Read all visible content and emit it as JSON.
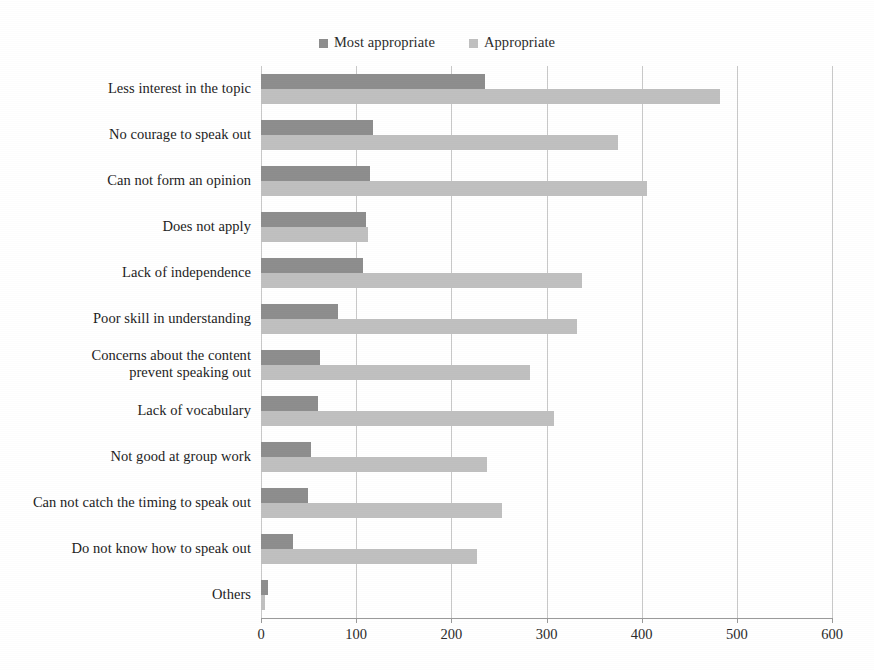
{
  "chart_data": {
    "type": "bar",
    "orientation": "horizontal",
    "title": "",
    "xlabel": "",
    "ylabel": "",
    "xlim": [
      0,
      600
    ],
    "xticks": [
      0,
      100,
      200,
      300,
      400,
      500,
      600
    ],
    "grid": true,
    "legend_position": "top-center",
    "categories": [
      "Less interest in the topic",
      "No courage to speak out",
      "Can not form an opinion",
      "Does not apply",
      "Lack of independence",
      "Poor skill in understanding",
      "Concerns about the content\nprevent speaking out",
      "Lack of vocabulary",
      "Not good at group work",
      "Can not catch the timing to speak out",
      "Do not know how to speak out",
      "Others"
    ],
    "series": [
      {
        "name": "Most appropriate",
        "color": "#8e8e8e",
        "values": [
          235,
          118,
          115,
          110,
          107,
          81,
          62,
          60,
          53,
          49,
          34,
          7
        ]
      },
      {
        "name": "Appropriate",
        "color": "#c0c0c0",
        "values": [
          482,
          375,
          406,
          112,
          337,
          332,
          283,
          308,
          238,
          253,
          227,
          4
        ]
      }
    ]
  }
}
